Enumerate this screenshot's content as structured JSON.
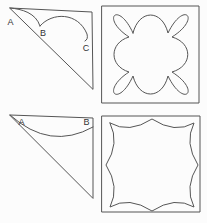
{
  "colors": {
    "background": "#fcfcfc",
    "line": "#555555",
    "label": "#333333"
  },
  "figures": {
    "triangle_top": {
      "labels": {
        "a": "A",
        "b": "B",
        "c": "C"
      }
    },
    "triangle_bottom": {
      "labels": {
        "a": "A",
        "b": "B"
      }
    }
  }
}
